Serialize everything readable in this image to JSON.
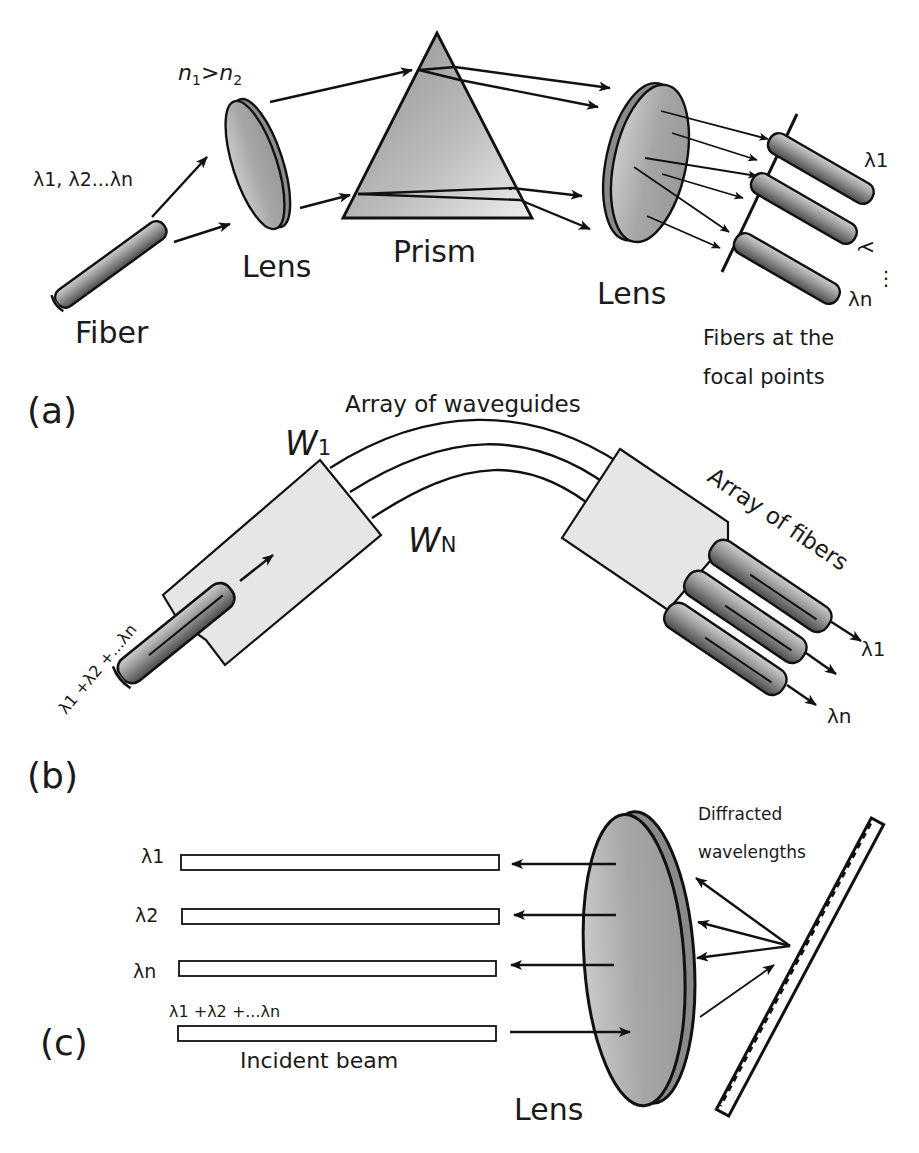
{
  "figure": {
    "panels": [
      {
        "id": "a",
        "label": "(a)",
        "title": "Prism-based wavelength demultiplexer",
        "texts": {
          "input_wavelengths": "λ1, λ2...λn",
          "index_relation_n1": "n",
          "index_relation_sub1": "1",
          "index_relation_gt": ">",
          "index_relation_n2": "n",
          "index_relation_sub2": "2",
          "fiber": "Fiber",
          "lens_in": "Lens",
          "prism": "Prism",
          "lens_out": "Lens",
          "out_lambda_1": "λ1",
          "out_lambda_mid": "λ",
          "out_lambda_n": "λn",
          "dots": "⋮",
          "fibers_focal_line1": "Fibers at the",
          "fibers_focal_line2": "focal points"
        }
      },
      {
        "id": "b",
        "label": "(b)",
        "title": "Arrayed waveguide grating",
        "texts": {
          "array_of_waveguides": "Array of waveguides",
          "w1_letter": "W",
          "w1_sub": "1",
          "wn_letter": "W",
          "wn_sub": "N",
          "input_sum": "λ1 +λ2 +...λn",
          "array_of_fibers": "Array of fibers",
          "out_lambda_1": "λ1",
          "out_lambda_n": "λn"
        }
      },
      {
        "id": "c",
        "label": "(c)",
        "title": "Diffraction grating demultiplexer",
        "texts": {
          "lambda_1": "λ1",
          "lambda_2": "λ2",
          "lambda_n": "λn",
          "input_sum": "λ1 +λ2 +...λn",
          "incident_beam": "Incident beam",
          "lens": "Lens",
          "diffracted_line1": "Diffracted",
          "diffracted_line2": "wavelengths"
        }
      }
    ],
    "colors": {
      "stroke": "#111111",
      "lens_face": "#a9a9a9",
      "lens_rim": "#8a8a8a",
      "block_fill": "#e6e6e6",
      "fiber_dark": "#5e5e5e",
      "fiber_light": "#c8c8c8",
      "background": "#ffffff"
    }
  }
}
